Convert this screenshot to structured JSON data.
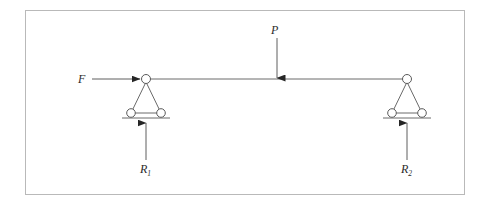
{
  "figure": {
    "kind": "free-body-diagram",
    "frame_border_color": "#b9b9b9",
    "line_color": "#555555",
    "arrow_color": "#333333",
    "background_color": "#ffffff"
  },
  "labels": {
    "applied_horizontal_force": "F",
    "applied_vertical_load": "P",
    "reaction_left": "R",
    "reaction_left_subscript": "1",
    "reaction_right": "R",
    "reaction_right_subscript": "2"
  },
  "geometry": {
    "beam": {
      "x1": 146,
      "y1": 79,
      "x2": 407,
      "y2": 79
    },
    "left_support": {
      "apex_x": 146,
      "apex_y": 79,
      "base_y": 117,
      "base_left_x": 131,
      "base_right_x": 161,
      "ground_x1": 122,
      "ground_x2": 170,
      "pin_radius": 4.5,
      "roller_radius": 4.5
    },
    "right_support": {
      "apex_x": 407,
      "apex_y": 79,
      "base_y": 117,
      "base_left_x": 392,
      "base_right_x": 422,
      "ground_x1": 383,
      "ground_x2": 431,
      "pin_radius": 4.5,
      "roller_radius": 4.5
    },
    "force_F_arrow": {
      "x1": 92,
      "y1": 79,
      "x2": 140,
      "y2": 79,
      "direction": "right"
    },
    "load_P_arrow": {
      "x1": 277,
      "y1": 38,
      "x2": 277,
      "y2": 78,
      "direction": "down"
    },
    "reaction_R1_arrow": {
      "x1": 146,
      "y1": 160,
      "x2": 146,
      "y2": 124,
      "direction": "up"
    },
    "reaction_R2_arrow": {
      "x1": 407,
      "y1": 160,
      "x2": 407,
      "y2": 124,
      "direction": "up"
    }
  }
}
